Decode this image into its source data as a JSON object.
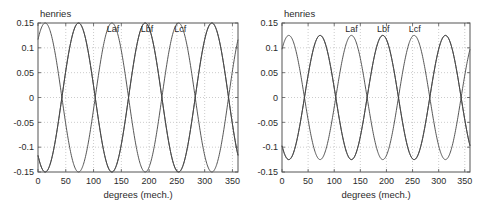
{
  "figure": {
    "title": "",
    "background_color": "#ffffff",
    "axis_color": "#555555",
    "grid_color": "#bfbfbf",
    "curve_color": "#444444"
  },
  "panels": [
    {
      "id": "left",
      "unit_label": "henries",
      "xlabel": "degrees (mech.)",
      "ylabel": "",
      "xticks": [
        "0",
        "50",
        "100",
        "150",
        "200",
        "250",
        "300",
        "350"
      ],
      "yticks": [
        "0.15",
        "0.1",
        "0.05",
        "0",
        "-0.05",
        "-0.1",
        "-0.15"
      ],
      "curve_labels": [
        "Laf",
        "Lbf",
        "Lcf"
      ]
    },
    {
      "id": "right",
      "unit_label": "henries",
      "xlabel": "degrees (mech.)",
      "ylabel": "",
      "xticks": [
        "0",
        "50",
        "100",
        "150",
        "200",
        "250",
        "300",
        "350"
      ],
      "yticks": [
        "0.15",
        "0.1",
        "0.05",
        "0",
        "-0.05",
        "-0.1",
        "-0.15"
      ],
      "curve_labels": [
        "Laf",
        "Lbf",
        "Lcf"
      ]
    }
  ],
  "chart_data": [
    {
      "type": "line",
      "id": "left-plot",
      "title": "",
      "xlabel": "degrees (mech.)",
      "ylabel": "henries",
      "xlim": [
        0,
        360
      ],
      "ylim": [
        -0.15,
        0.15
      ],
      "xticks": [
        0,
        50,
        100,
        150,
        200,
        250,
        300,
        350
      ],
      "yticks": [
        0.15,
        0.1,
        0.05,
        0,
        -0.05,
        -0.1,
        -0.15
      ],
      "grid": true,
      "legend": "inline-annotations",
      "amplitude": 0.15,
      "period_degrees": 120,
      "series": [
        {
          "name": "Laf",
          "amplitude": 0.15,
          "period_degrees": 120,
          "phase_degrees": 13,
          "annotation_x": 135
        },
        {
          "name": "Lbf",
          "amplitude": 0.15,
          "period_degrees": 120,
          "phase_degrees": 73,
          "annotation_x": 196
        },
        {
          "name": "Lcf",
          "amplitude": 0.15,
          "period_degrees": 120,
          "phase_degrees": -47,
          "annotation_x": 256
        }
      ]
    },
    {
      "type": "line",
      "id": "right-plot",
      "title": "",
      "xlabel": "degrees (mech.)",
      "ylabel": "henries",
      "xlim": [
        0,
        360
      ],
      "ylim": [
        -0.15,
        0.15
      ],
      "xticks": [
        0,
        50,
        100,
        150,
        200,
        250,
        300,
        350
      ],
      "yticks": [
        0.15,
        0.1,
        0.05,
        0,
        -0.05,
        -0.1,
        -0.15
      ],
      "grid": true,
      "legend": "inline-annotations",
      "amplitude": 0.125,
      "period_degrees": 120,
      "series": [
        {
          "name": "Laf",
          "amplitude": 0.125,
          "period_degrees": 120,
          "phase_degrees": 13,
          "annotation_x": 133
        },
        {
          "name": "Lbf",
          "amplitude": 0.125,
          "period_degrees": 120,
          "phase_degrees": 73,
          "annotation_x": 194
        },
        {
          "name": "Lcf",
          "amplitude": 0.125,
          "period_degrees": 120,
          "phase_degrees": -47,
          "annotation_x": 254
        }
      ]
    }
  ]
}
